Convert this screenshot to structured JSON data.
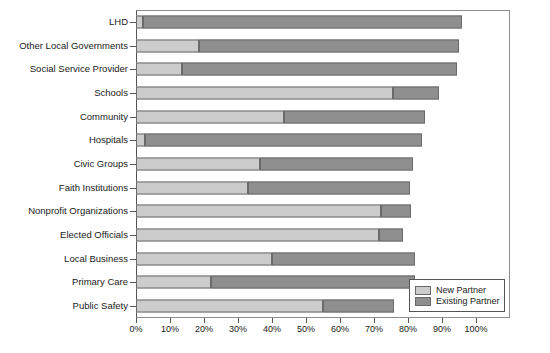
{
  "chart_data": {
    "type": "bar",
    "orientation": "horizontal",
    "stacked": true,
    "title": "",
    "subtitle": "",
    "xlabel": "",
    "ylabel": "",
    "xlim": [
      0,
      100
    ],
    "grid": false,
    "legend_position": "bottom-right",
    "xticklabels": [
      "0%",
      "10%",
      "20%",
      "30%",
      "40%",
      "50%",
      "60%",
      "70%",
      "80%",
      "90%",
      "100%"
    ],
    "xticks": [
      0,
      10,
      20,
      30,
      40,
      50,
      60,
      70,
      80,
      90,
      100
    ],
    "categories": [
      "LHD",
      "Other Local Governments",
      "Social Service Provider",
      "Schools",
      "Community",
      "Hospitals",
      "Civic Groups",
      "Faith Institutions",
      "Nonprofit Organizations",
      "Elected Officials",
      "Local Business",
      "Primary Care",
      "Public Safety"
    ],
    "series": [
      {
        "name": "New Partner",
        "color": "#cccccc",
        "values": [
          2,
          18.5,
          13.5,
          75.5,
          43.5,
          2.5,
          36.5,
          33,
          72,
          71.5,
          40,
          22,
          55
        ]
      },
      {
        "name": "Existing Partner",
        "color": "#8f8f8f",
        "values": [
          94,
          76.5,
          81,
          13.5,
          41.5,
          81.5,
          45,
          47.5,
          9,
          7,
          42,
          60,
          21
        ]
      }
    ],
    "totals": [
      96,
      95,
      94.5,
      89,
      85,
      84,
      81.5,
      80.5,
      81,
      78.5,
      82,
      82,
      76
    ]
  },
  "legend": {
    "items": [
      {
        "label": "New Partner",
        "swatch": "legend-swatch-new-partner"
      },
      {
        "label": "Existing Partner",
        "swatch": "legend-swatch-existing-partner"
      }
    ]
  }
}
